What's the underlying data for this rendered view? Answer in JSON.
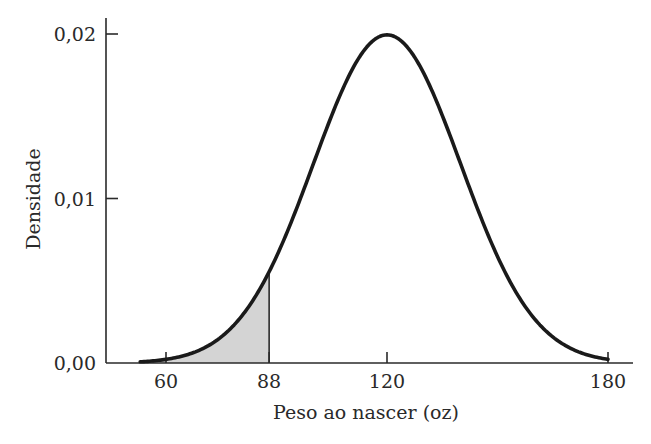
{
  "chart_data": {
    "type": "area",
    "title": "",
    "xlabel": "Peso ao nascer (oz)",
    "ylabel": "Densidade",
    "distribution": "normal",
    "mean": 120,
    "sd": 20,
    "x_ticks": [
      60,
      88,
      120,
      180
    ],
    "x_tick_labels": [
      "60",
      "88",
      "120",
      "180"
    ],
    "y_ticks": [
      0.0,
      0.01,
      0.02
    ],
    "y_tick_labels": [
      "0,00",
      "0,01",
      "0,02"
    ],
    "xlim": [
      45,
      188
    ],
    "ylim": [
      0,
      0.02
    ],
    "curve_x_range": [
      53,
      180
    ],
    "shaded_region": {
      "from": 53,
      "to": 88,
      "color": "#d4d4d4"
    },
    "line_color": "#1a1a1a",
    "grid": false,
    "legend": null,
    "series": [
      {
        "name": "Densidade normal",
        "x": [
          53,
          60,
          70,
          80,
          88,
          95,
          100,
          105,
          110,
          115,
          120,
          125,
          130,
          135,
          140,
          145,
          150,
          160,
          170,
          180
        ],
        "values": [
          0.0004,
          0.0009,
          0.0022,
          0.0054,
          0.0055,
          0.0092,
          0.0121,
          0.0151,
          0.0176,
          0.0193,
          0.0199,
          0.0193,
          0.0176,
          0.0151,
          0.0121,
          0.0092,
          0.0065,
          0.0027,
          0.0009,
          0.0002
        ]
      }
    ]
  }
}
